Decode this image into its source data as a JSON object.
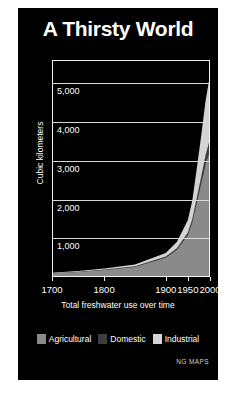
{
  "panel": {
    "background_color": "#000000",
    "page_background_color": "#ffffff"
  },
  "title": "A Thirsty World",
  "credit": "NG MAPS",
  "legend": {
    "position": "bottom-center",
    "items": [
      {
        "label": "Agricultural",
        "color": "#8a8a8a"
      },
      {
        "label": "Domestic",
        "color": "#3d3d3d"
      },
      {
        "label": "Industrial",
        "color": "#d4d4d4"
      }
    ]
  },
  "chart_data": {
    "type": "area",
    "stacked": true,
    "title": "A Thirsty World",
    "subtitle": "",
    "xlabel": "Total freshwater use over time",
    "ylabel": "Cubic kilometers",
    "grid": true,
    "legend_position": "bottom-center",
    "xlim": [
      1700,
      2000
    ],
    "ylim": [
      0,
      5600
    ],
    "ytick_labels": [
      "1,000",
      "2,000",
      "3,000",
      "4,000",
      "5,000"
    ],
    "ytick_values": [
      1000,
      2000,
      3000,
      4000,
      5000
    ],
    "xtick_labels": [
      "1700",
      "1800",
      "1900",
      "1950",
      "2000"
    ],
    "xtick_values": [
      1700,
      1800,
      1900,
      1950,
      2000
    ],
    "x_axis_scale": "non-linear",
    "x_positions_fraction": [
      0.0,
      0.33,
      0.72,
      0.86,
      1.0
    ],
    "x": [
      1700,
      1750,
      1800,
      1850,
      1900,
      1925,
      1950,
      1960,
      1970,
      1980,
      1990,
      2000
    ],
    "series": [
      {
        "name": "Agricultural",
        "color": "#8a8a8a",
        "values": [
          95,
          130,
          180,
          260,
          500,
          700,
          1080,
          1400,
          1900,
          2400,
          2900,
          3250
        ]
      },
      {
        "name": "Domestic",
        "color": "#3d3d3d",
        "values": [
          5,
          8,
          12,
          18,
          30,
          45,
          70,
          95,
          140,
          190,
          250,
          320
        ]
      },
      {
        "name": "Industrial",
        "color": "#d4d4d4",
        "values": [
          10,
          15,
          25,
          45,
          90,
          160,
          320,
          480,
          750,
          1050,
          1400,
          1650
        ]
      }
    ],
    "totals": [
      110,
      153,
      217,
      323,
      620,
      905,
      1470,
      1975,
      2790,
      3640,
      4550,
      5220
    ],
    "annotations": []
  }
}
